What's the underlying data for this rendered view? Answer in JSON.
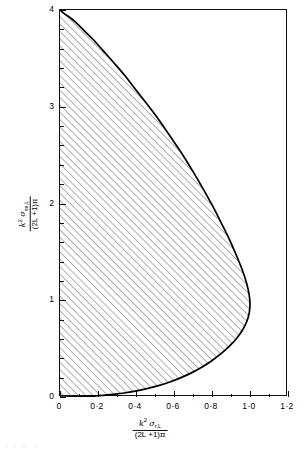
{
  "figure": {
    "name": "unitarity-limit-plot"
  },
  "chart_data": {
    "type": "area",
    "title": "",
    "xlabel": "k² σr,L / (2L+1)π",
    "ylabel": "k² σse,L / (2L+1)π",
    "xlim": [
      0,
      1.2
    ],
    "ylim": [
      0,
      4
    ],
    "grid": false,
    "legend": null,
    "fill": "diagonal-hatch",
    "annotations": [],
    "x_ticks_major": [
      0,
      0.2,
      0.4,
      0.6,
      0.8,
      1.0,
      1.2
    ],
    "x_tick_labels": [
      "0",
      "0·2",
      "0·4",
      "0·6",
      "0·8",
      "1·0",
      "1·2"
    ],
    "x_ticks_minor": [
      0.1,
      0.3,
      0.5,
      0.7,
      0.9,
      1.1
    ],
    "y_ticks_major": [
      0,
      1,
      2,
      3,
      4
    ],
    "y_tick_labels": [
      "0",
      "1",
      "2",
      "3",
      "4"
    ],
    "y_ticks_minor": [
      0.2,
      0.4,
      0.6,
      0.8,
      1.2,
      1.4,
      1.6,
      1.8,
      2.2,
      2.4,
      2.6,
      2.8,
      3.2,
      3.4,
      3.6,
      3.8
    ],
    "curve_name": "unitarity-boundary",
    "curve_description": "Teardrop boundary of allowed region: starts at (0,4), bulges right to maximum x=1.0 near y=1.4, returns to origin (0,0)",
    "x": [
      0.0,
      0.024,
      0.054,
      0.09,
      0.131,
      0.177,
      0.227,
      0.281,
      0.338,
      0.397,
      0.457,
      0.518,
      0.578,
      0.637,
      0.694,
      0.748,
      0.799,
      0.846,
      0.889,
      0.927,
      0.96,
      0.983,
      0.996,
      1.0,
      0.996,
      0.983,
      0.96,
      0.927,
      0.889,
      0.846,
      0.799,
      0.748,
      0.694,
      0.637,
      0.578,
      0.518,
      0.457,
      0.397,
      0.338,
      0.281,
      0.227,
      0.177,
      0.131,
      0.09,
      0.054,
      0.024,
      0.0
    ],
    "y": [
      4.0,
      3.96,
      3.92,
      3.86,
      3.78,
      3.69,
      3.58,
      3.46,
      3.33,
      3.18,
      3.03,
      2.87,
      2.7,
      2.53,
      2.35,
      2.17,
      1.99,
      1.81,
      1.64,
      1.47,
      1.31,
      1.17,
      1.05,
      0.96,
      0.87,
      0.78,
      0.69,
      0.6,
      0.52,
      0.445,
      0.375,
      0.31,
      0.252,
      0.2,
      0.155,
      0.117,
      0.086,
      0.061,
      0.041,
      0.027,
      0.016,
      0.009,
      0.005,
      0.002,
      0.001,
      0.0,
      0.0
    ]
  },
  "axes": {
    "x_title": {
      "numerator_k": "k",
      "numerator_exp": "2",
      "numerator_sigma": "σ",
      "numerator_sub": "r,L",
      "denominator": "(2L +1)",
      "denominator_pi": "π"
    },
    "y_title": {
      "numerator_k": "k",
      "numerator_exp": "2",
      "numerator_sigma": "σ",
      "numerator_sub": "se,L",
      "denominator": "(2L +1)",
      "denominator_pi": "π"
    }
  },
  "colors": {
    "axis": "#111111",
    "curve": "#000000",
    "hatch": "#555555",
    "background": "#ffffff"
  }
}
